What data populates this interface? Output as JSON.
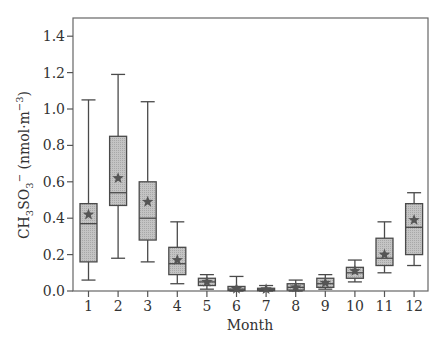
{
  "chart_data": {
    "type": "box",
    "title": "",
    "xlabel": "Month",
    "ylabel": "CH3SO3- (nmol·m-3)",
    "ylabel_parts": {
      "base1": "CH",
      "sub1": "3",
      "base2": "SO",
      "sub2": "3",
      "sup1": "−",
      "unit_pre": "(nmol·m",
      "unit_sup": "−3",
      "unit_post": ")"
    },
    "ylim": [
      0.0,
      1.5
    ],
    "yticks": [
      0.0,
      0.2,
      0.4,
      0.6,
      0.8,
      1.0,
      1.2,
      1.4
    ],
    "ytick_labels": [
      "0.0",
      "0.2",
      "0.4",
      "0.6",
      "0.8",
      "1.0",
      "1.2",
      "1.4"
    ],
    "categories": [
      "1",
      "2",
      "3",
      "4",
      "5",
      "6",
      "7",
      "8",
      "9",
      "10",
      "11",
      "12"
    ],
    "grid": false,
    "legend": null,
    "mean_marker": "star",
    "series": [
      {
        "name": "CH3SO3-",
        "boxes": [
          {
            "month": "1",
            "whisker_low": 0.06,
            "q1": 0.16,
            "median": 0.37,
            "q3": 0.48,
            "whisker_high": 1.05,
            "mean": 0.42
          },
          {
            "month": "2",
            "whisker_low": 0.18,
            "q1": 0.47,
            "median": 0.54,
            "q3": 0.85,
            "whisker_high": 1.19,
            "mean": 0.62
          },
          {
            "month": "3",
            "whisker_low": 0.16,
            "q1": 0.28,
            "median": 0.4,
            "q3": 0.6,
            "whisker_high": 1.04,
            "mean": 0.49
          },
          {
            "month": "4",
            "whisker_low": 0.04,
            "q1": 0.09,
            "median": 0.15,
            "q3": 0.24,
            "whisker_high": 0.38,
            "mean": 0.17
          },
          {
            "month": "5",
            "whisker_low": 0.01,
            "q1": 0.03,
            "median": 0.05,
            "q3": 0.07,
            "whisker_high": 0.09,
            "mean": 0.05
          },
          {
            "month": "6",
            "whisker_low": 0.0,
            "q1": 0.003,
            "median": 0.01,
            "q3": 0.025,
            "whisker_high": 0.08,
            "mean": 0.012
          },
          {
            "month": "7",
            "whisker_low": 0.0,
            "q1": 0.002,
            "median": 0.007,
            "q3": 0.015,
            "whisker_high": 0.03,
            "mean": 0.01
          },
          {
            "month": "8",
            "whisker_low": 0.0,
            "q1": 0.005,
            "median": 0.02,
            "q3": 0.04,
            "whisker_high": 0.06,
            "mean": 0.02
          },
          {
            "month": "9",
            "whisker_low": 0.01,
            "q1": 0.02,
            "median": 0.04,
            "q3": 0.07,
            "whisker_high": 0.09,
            "mean": 0.045
          },
          {
            "month": "10",
            "whisker_low": 0.05,
            "q1": 0.07,
            "median": 0.1,
            "q3": 0.13,
            "whisker_high": 0.17,
            "mean": 0.11
          },
          {
            "month": "11",
            "whisker_low": 0.1,
            "q1": 0.14,
            "median": 0.18,
            "q3": 0.29,
            "whisker_high": 0.38,
            "mean": 0.2
          },
          {
            "month": "12",
            "whisker_low": 0.14,
            "q1": 0.2,
            "median": 0.35,
            "q3": 0.48,
            "whisker_high": 0.54,
            "mean": 0.39
          }
        ]
      }
    ]
  },
  "colors": {
    "box_fill": "#b8b8b8",
    "stroke": "#4a4a4a",
    "mean_marker": "#555555",
    "axis": "#555555",
    "text": "#333333"
  },
  "layout": {
    "plot_left": 73,
    "plot_right": 428,
    "plot_top": 18,
    "plot_bottom": 291,
    "y_px_per_unit": 182,
    "first_x": 88.5,
    "x_step": 29.6,
    "box_width": 17,
    "cap_width": 14
  }
}
